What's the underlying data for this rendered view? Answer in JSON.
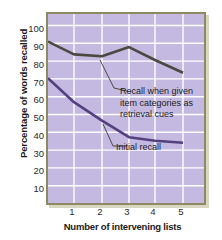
{
  "chart_data": {
    "type": "line",
    "title": "",
    "xlabel": "Number of intervening lists",
    "ylabel": "Percentage of words recalled",
    "x": [
      0,
      1,
      2,
      3,
      4,
      5
    ],
    "xtick_labels": [
      "1",
      "2",
      "3",
      "4",
      "5"
    ],
    "xticks": [
      1,
      2,
      3,
      4,
      5
    ],
    "ytick_labels": [
      "100",
      "90",
      "80",
      "70",
      "60",
      "50",
      "40",
      "30",
      "20",
      "10"
    ],
    "yticks": [
      100,
      90,
      80,
      70,
      60,
      50,
      40,
      30,
      20,
      10
    ],
    "ylim": [
      0,
      105
    ],
    "xlim": [
      0,
      5.6
    ],
    "grid": true,
    "legend_position": "inline-annotations",
    "series": [
      {
        "name": "Recall when given item categories as retrieval cues",
        "color": "#4a4a42",
        "values": [
          90,
          83,
          82,
          87,
          80,
          73
        ]
      },
      {
        "name": "Initial recall",
        "color": "#54407e",
        "values": [
          70,
          57,
          47,
          38,
          36,
          35
        ]
      }
    ],
    "annotations": [
      {
        "id": "cued",
        "text_lines": [
          "Recall when given",
          "item categories as",
          "retrieval cues"
        ],
        "target_series": "Recall when given item categories as retrieval cues"
      },
      {
        "id": "initial",
        "text_lines": [
          "Initial recall"
        ],
        "target_series": "Initial recall"
      }
    ],
    "colors": {
      "plot_background": "#c4b9e0",
      "gridline": "#ffffff",
      "border": "#8d8a62",
      "shadow": "#b9b48f",
      "series_cued": "#4a4a42",
      "series_initial": "#54407e",
      "text": "#1a1a1a"
    }
  }
}
